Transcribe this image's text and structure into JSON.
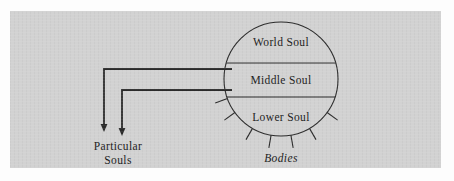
{
  "figure": {
    "background_color": "#d2d2d2",
    "ink_color": "#2b2b2b",
    "page_color": "#fdfdfd"
  },
  "circle": {
    "center_x": 281,
    "center_y": 79,
    "radius": 57,
    "bands": [
      {
        "key": "world",
        "label": "World Soul",
        "label_x": 281,
        "label_y": 46
      },
      {
        "key": "middle",
        "label": "Middle Soul",
        "label_x": 281,
        "label_y": 84
      },
      {
        "key": "lower",
        "label": "Lower Soul",
        "label_x": 281,
        "label_y": 121
      }
    ],
    "dividers": [
      {
        "key": "world-middle",
        "y": 63
      },
      {
        "key": "middle-lower",
        "y": 97
      }
    ]
  },
  "rays": {
    "label": "Bodies",
    "label_x": 281,
    "label_y": 162,
    "count": 7,
    "angles_deg": [
      36,
      60,
      80,
      100,
      120,
      144,
      20
    ],
    "inner_radius": 57,
    "outer_radius": 70
  },
  "connectors": {
    "label": "Particular\nSouls",
    "label_line_1": "Particular",
    "label_line_2": "Souls",
    "label_1_x": 118,
    "label_1_y": 150,
    "label_2_x": 118,
    "label_2_y": 164,
    "paths": [
      {
        "key": "middle-to-particular-upper",
        "start_x": 232,
        "start_y": 69,
        "corner_x": 104,
        "corner_y": 69,
        "end_x": 104,
        "end_y": 132
      },
      {
        "key": "middle-to-particular-lower",
        "start_x": 232,
        "start_y": 90,
        "corner_x": 122,
        "corner_y": 90,
        "end_x": 122,
        "end_y": 136
      }
    ]
  }
}
